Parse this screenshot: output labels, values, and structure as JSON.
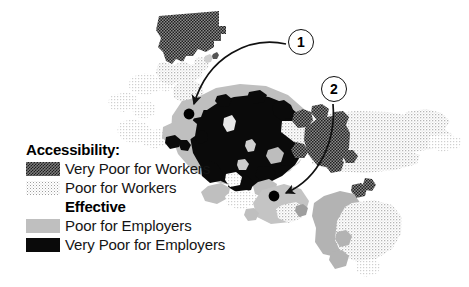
{
  "figure": {
    "type": "thematic-choropleth-map",
    "background_color": "#ffffff"
  },
  "legend": {
    "heading_accessibility": "Accessibility:",
    "heading_effective": "Effective",
    "items": [
      {
        "label": "Very Poor for Workers",
        "swatch": "dense-checker-dark",
        "color": "#3d3d3d"
      },
      {
        "label": "Poor for Workers",
        "swatch": "sparse-dots-light",
        "color": "#d8d8d8"
      },
      {
        "label": "Poor for Employers",
        "swatch": "solid-gray",
        "color": "#bfbfbf"
      },
      {
        "label": "Very Poor for Employers",
        "swatch": "solid-black",
        "color": "#0a0a0a"
      }
    ]
  },
  "annotations": [
    {
      "id": "1",
      "label": "1",
      "arrow": "curves left and down to marker dot on west side of core"
    },
    {
      "id": "2",
      "label": "2",
      "arrow": "curves down and left to marker dot south-east of core"
    }
  ],
  "map_regions": [
    {
      "name": "northern-very-poor-workers-polygon",
      "fill": "dense-checker-dark"
    },
    {
      "name": "central-very-poor-employers-core",
      "fill": "solid-black"
    },
    {
      "name": "inner-poor-employers-ring",
      "fill": "solid-gray"
    },
    {
      "name": "eastern-poor-workers-field",
      "fill": "sparse-dots-light"
    },
    {
      "name": "eastern-very-poor-workers-cluster",
      "fill": "dense-checker-dark"
    },
    {
      "name": "southeast-poor-workers-island",
      "fill": "sparse-dots-light"
    },
    {
      "name": "southeast-poor-employers-patch",
      "fill": "solid-gray"
    }
  ],
  "markers": [
    {
      "name": "marker-dot-1"
    },
    {
      "name": "marker-dot-2"
    }
  ],
  "colors": {
    "very_poor_workers": "#3d3d3d",
    "poor_workers": "#d8d8d8",
    "poor_employers": "#bfbfbf",
    "very_poor_employers": "#0a0a0a",
    "annotation_stroke": "#111111"
  }
}
